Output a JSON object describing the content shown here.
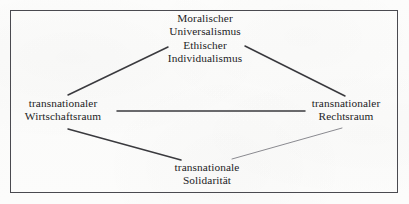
{
  "diagram": {
    "frame": {
      "border_color": "#4a4a50",
      "background_color": "#fdfdfc"
    },
    "line_color": "#3a3a3e",
    "line_color_light": "#8a8a90",
    "text_color": "#1d1d1f",
    "nodes": {
      "top": {
        "name": "moralischer-universalismus",
        "lines": [
          "Moralischer",
          "Universalismus",
          "Ethischer",
          "Individualismus"
        ]
      },
      "left": {
        "name": "transnationaler-wirtschaftsraum",
        "lines": [
          "transnationaler",
          "Wirtschaftsraum"
        ]
      },
      "right": {
        "name": "transnationaler-rechtsraum",
        "lines": [
          "transnationaler",
          "Rechtsraum"
        ]
      },
      "bottom": {
        "name": "transnationale-solidaritaet",
        "lines": [
          "transnationale",
          "Solidarität"
        ]
      }
    },
    "edges": [
      {
        "name": "edge-top-left",
        "from": "top",
        "to": "left",
        "x1": 168,
        "y1": 47,
        "x2": 68,
        "y2": 95,
        "weight": 1.5,
        "shade": "dark"
      },
      {
        "name": "edge-top-right",
        "from": "top",
        "to": "right",
        "x1": 245,
        "y1": 46,
        "x2": 345,
        "y2": 96,
        "weight": 1.5,
        "shade": "dark"
      },
      {
        "name": "edge-left-right",
        "from": "left",
        "to": "right",
        "x1": 117,
        "y1": 111,
        "x2": 305,
        "y2": 111,
        "weight": 1.5,
        "shade": "dark"
      },
      {
        "name": "edge-left-bottom",
        "from": "left",
        "to": "bottom",
        "x1": 68,
        "y1": 129,
        "x2": 181,
        "y2": 160,
        "weight": 1.5,
        "shade": "dark"
      },
      {
        "name": "edge-right-bottom",
        "from": "right",
        "to": "bottom",
        "x1": 342,
        "y1": 128,
        "x2": 232,
        "y2": 159,
        "weight": 1.0,
        "shade": "light"
      }
    ]
  }
}
